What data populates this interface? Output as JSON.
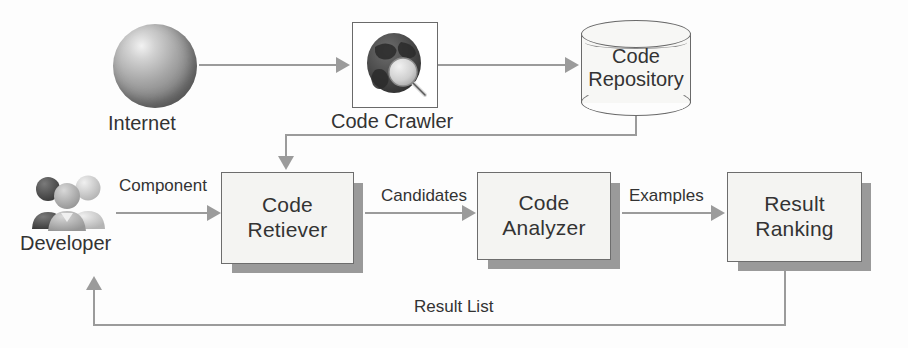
{
  "diagram": {
    "background_color": "#fdfdfd",
    "line_color": "#9b9b9b",
    "box_fill": "#f4f4f2",
    "box_border": "#6d6d6d",
    "shadow_color": "#9a9a9a"
  },
  "nodes": {
    "internet": {
      "label": "Internet",
      "icon": "globe-sphere-icon"
    },
    "crawler": {
      "label": "Code Crawler",
      "icon": "globe-magnifier-icon"
    },
    "repository": {
      "label_line1": "Code",
      "label_line2": "Repository",
      "icon": "database-cylinder-icon"
    },
    "developer": {
      "label": "Developer",
      "icon": "people-group-icon"
    },
    "retriever": {
      "label_line1": "Code",
      "label_line2": "Retiever"
    },
    "analyzer": {
      "label_line1": "Code",
      "label_line2": "Analyzer"
    },
    "ranking": {
      "label_line1": "Result",
      "label_line2": "Ranking"
    }
  },
  "edges": {
    "developer_to_retriever": "Component",
    "retriever_to_analyzer": "Candidates",
    "analyzer_to_ranking": "Examples",
    "ranking_to_developer": "Result List"
  }
}
